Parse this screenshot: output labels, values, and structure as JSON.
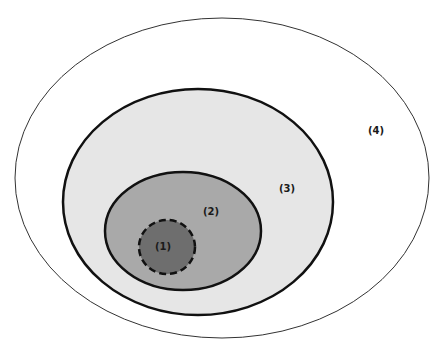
{
  "diagram": {
    "type": "nested-ellipses",
    "regions": [
      {
        "id": "region-4",
        "label": "(4)",
        "shape": "ellipse",
        "cx": 222,
        "cy": 178,
        "rx": 207,
        "ry": 160,
        "fill": "#ffffff",
        "stroke": "#333333",
        "stroke_width": 1,
        "dashed": false,
        "label_x": 376,
        "label_y": 131
      },
      {
        "id": "region-3",
        "label": "(3)",
        "shape": "ellipse",
        "cx": 198,
        "cy": 202,
        "rx": 135,
        "ry": 113,
        "fill": "#e6e6e6",
        "stroke": "#111111",
        "stroke_width": 2.5,
        "dashed": false,
        "label_x": 287,
        "label_y": 189
      },
      {
        "id": "region-2",
        "label": "(2)",
        "shape": "ellipse",
        "cx": 183,
        "cy": 231,
        "rx": 78,
        "ry": 59,
        "fill": "#a9a9a9",
        "stroke": "#111111",
        "stroke_width": 2.5,
        "dashed": false,
        "label_x": 211,
        "label_y": 212
      },
      {
        "id": "region-1",
        "label": "(1)",
        "shape": "circle",
        "cx": 167,
        "cy": 247,
        "rx": 28,
        "ry": 27,
        "fill": "#6e6e6e",
        "stroke": "#111111",
        "stroke_width": 2.5,
        "dashed": true,
        "label_x": 163,
        "label_y": 247
      }
    ]
  }
}
